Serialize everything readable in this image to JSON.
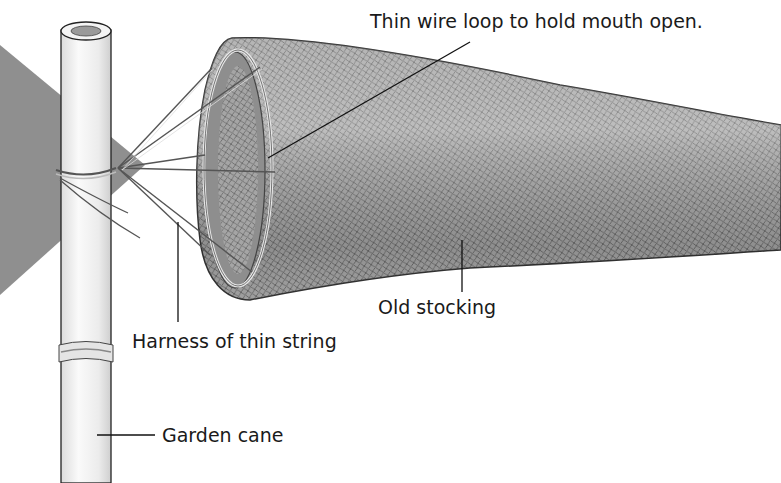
{
  "figure": {
    "type": "labeled-illustration",
    "colors": {
      "background": "#ffffff",
      "flag_grey": "#8a8a8a",
      "stocking_grey": "#9a9a9a",
      "cane": "#f2f2f2",
      "ink": "#1a1a1a"
    }
  },
  "labels": {
    "wire_loop": "Thin wire loop to hold mouth open.",
    "stocking": "Old stocking",
    "harness": "Harness of thin string",
    "cane": "Garden cane"
  }
}
